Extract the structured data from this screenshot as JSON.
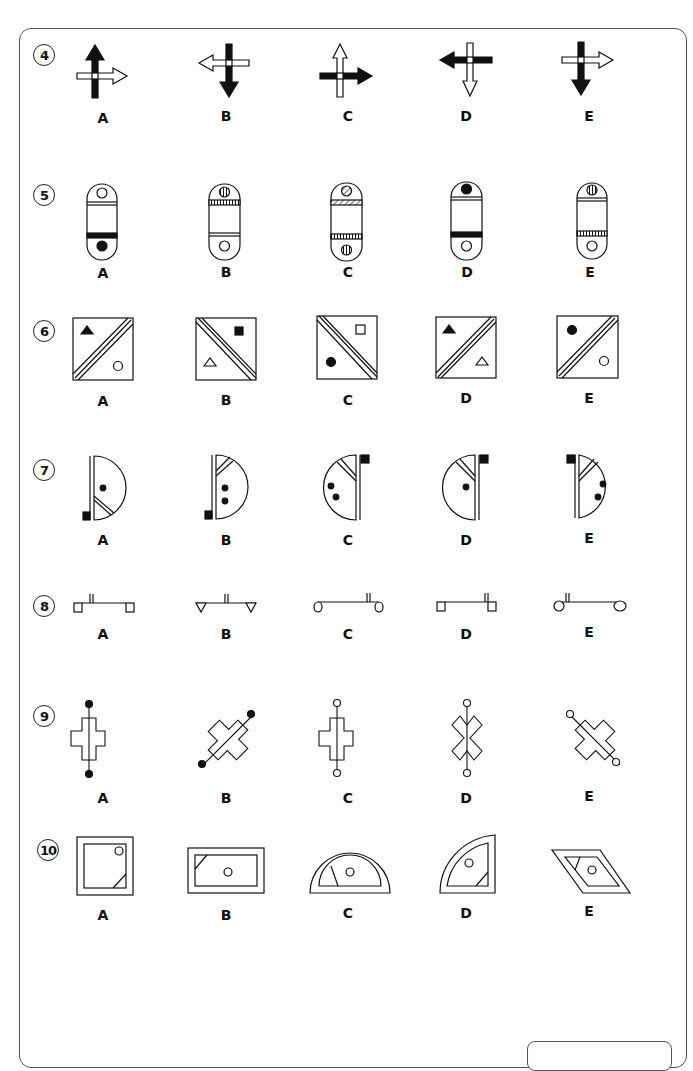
{
  "page": {
    "questions": [
      {
        "number": "4",
        "options": [
          "A",
          "B",
          "C",
          "D",
          "E"
        ],
        "figure": "arrow-cross"
      },
      {
        "number": "5",
        "options": [
          "A",
          "B",
          "C",
          "D",
          "E"
        ],
        "figure": "capsule"
      },
      {
        "number": "6",
        "options": [
          "A",
          "B",
          "C",
          "D",
          "E"
        ],
        "figure": "diagonal-square"
      },
      {
        "number": "7",
        "options": [
          "A",
          "B",
          "C",
          "D",
          "E"
        ],
        "figure": "half-circle"
      },
      {
        "number": "8",
        "options": [
          "A",
          "B",
          "C",
          "D",
          "E"
        ],
        "figure": "bar-with-feet"
      },
      {
        "number": "9",
        "options": [
          "A",
          "B",
          "C",
          "D",
          "E"
        ],
        "figure": "cross-with-rod"
      },
      {
        "number": "10",
        "options": [
          "A",
          "B",
          "C",
          "D",
          "E"
        ],
        "figure": "framed-shape"
      }
    ]
  },
  "colors": {
    "ink": "#111111",
    "frame": "#555555",
    "background": "#ffffff"
  }
}
